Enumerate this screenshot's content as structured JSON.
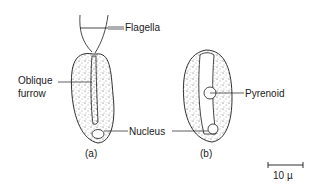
{
  "labels": {
    "flagella": "Flagella",
    "oblique_line1": "Oblique",
    "oblique_line2": "furrow",
    "nucleus": "Nucleus",
    "pyrenoid": "Pyrenoid",
    "panel_a": "(a)",
    "panel_b": "(b)",
    "scale": "10 µ"
  },
  "colors": {
    "ink": "#1a1a1a",
    "background": "#ffffff"
  }
}
